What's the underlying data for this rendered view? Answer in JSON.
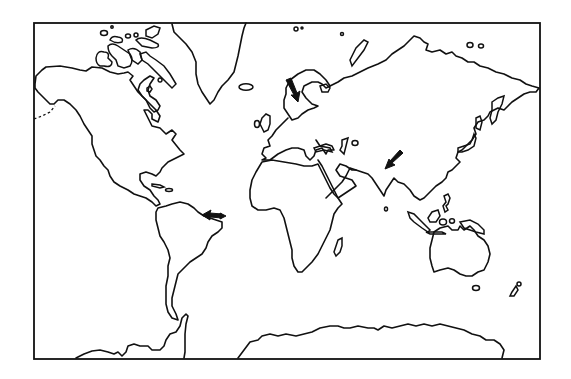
{
  "figure": {
    "type": "world-map-outline",
    "projection": "Mercator-like",
    "colors": {
      "ink": "#111111",
      "background": "#ffffff"
    },
    "frame": {
      "x": 34,
      "y": 22,
      "width": 506,
      "height": 337
    },
    "arrows": [
      {
        "id": "arrow-scandinavia",
        "region": "Scandinavia",
        "direction": "down",
        "tail": [
          289,
          80
        ],
        "head": [
          297,
          100
        ]
      },
      {
        "id": "arrow-brazil",
        "region": "Brazil (northeast coast)",
        "direction": "left",
        "tail": [
          224,
          216
        ],
        "head": [
          202,
          214
        ]
      },
      {
        "id": "arrow-india",
        "region": "Northern India / Himalaya",
        "direction": "down-left",
        "tail": [
          402,
          152
        ],
        "head": [
          386,
          168
        ]
      }
    ],
    "landmasses": [
      "North America",
      "Greenland",
      "Canadian Arctic Archipelago",
      "South America",
      "Europe",
      "Africa",
      "Madagascar",
      "Asia",
      "Japan",
      "Indonesia",
      "Australia",
      "New Zealand",
      "Antarctica",
      "Antarctic Peninsula"
    ]
  }
}
